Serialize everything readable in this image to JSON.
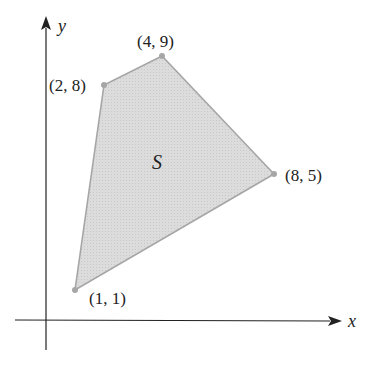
{
  "axes": {
    "x_label": "x",
    "y_label": "y"
  },
  "region": {
    "label": "S",
    "fill_color": "#d9d9d9",
    "edge_color": "#a6a6a6"
  },
  "vertices": [
    {
      "label": "(1, 1)",
      "x": 1,
      "y": 1
    },
    {
      "label": "(2, 8)",
      "x": 2,
      "y": 8
    },
    {
      "label": "(4, 9)",
      "x": 4,
      "y": 9
    },
    {
      "label": "(8, 5)",
      "x": 8,
      "y": 5
    }
  ],
  "colors": {
    "axis": "#222222",
    "vertex_dot": "#a6a6a6"
  }
}
